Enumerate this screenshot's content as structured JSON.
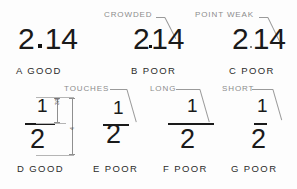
{
  "figure": {
    "background_color": "#fdfdfd",
    "ink_color": "#1a1a1a",
    "annotation_color": "#8c8c8c"
  },
  "row1": {
    "examples": [
      {
        "id": "A",
        "numeral_whole": "2",
        "numeral_decimal_point": ".",
        "numeral_fraction": "14",
        "numeral_full": "2.14",
        "caption": "A  GOOD",
        "caption_letter": "A",
        "caption_verdict": "GOOD",
        "callout": ""
      },
      {
        "id": "B",
        "numeral_whole": "2",
        "numeral_decimal_point": ".",
        "numeral_fraction": "14",
        "numeral_full": "2.14",
        "caption": "B  POOR",
        "caption_letter": "B",
        "caption_verdict": "POOR",
        "callout": "CROWDED"
      },
      {
        "id": "C",
        "numeral_whole": "2",
        "numeral_decimal_point": ".",
        "numeral_fraction": "14",
        "numeral_full": "2.14",
        "caption": "C  POOR",
        "caption_letter": "C",
        "caption_verdict": "POOR",
        "callout": "POINT WEAK"
      }
    ]
  },
  "row2": {
    "examples": [
      {
        "id": "D",
        "numerator": "1",
        "denominator": "2",
        "fraction_full": "1/2",
        "caption": "D  GOOD",
        "caption_letter": "D",
        "caption_verdict": "GOOD",
        "callout": ""
      },
      {
        "id": "E",
        "numerator": "1",
        "denominator": "2",
        "fraction_full": "1/2",
        "caption": "E  POOR",
        "caption_letter": "E",
        "caption_verdict": "POOR",
        "callout": "TOUCHES"
      },
      {
        "id": "F",
        "numerator": "1",
        "denominator": "2",
        "fraction_full": "1/2",
        "caption": "F  POOR",
        "caption_letter": "F",
        "caption_verdict": "POOR",
        "callout": "LONG"
      },
      {
        "id": "G",
        "numerator": "1",
        "denominator": "2",
        "fraction_full": "1/2",
        "caption": "G  POOR",
        "caption_letter": "G",
        "caption_verdict": "POOR",
        "callout": "SHORT"
      }
    ]
  },
  "dimensions": {
    "inner_label": "3/8",
    "outer_label": "4"
  }
}
